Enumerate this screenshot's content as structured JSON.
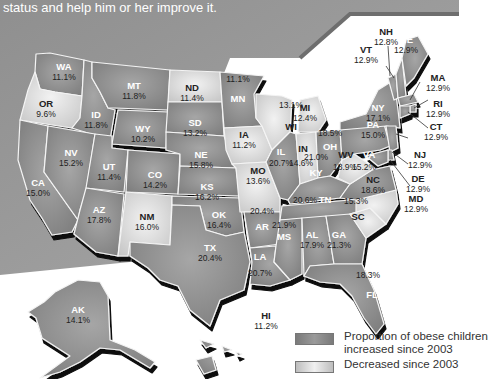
{
  "caption": {
    "line1": "status and help him or her improve it."
  },
  "legend": {
    "increased_label_1": "Proportion of obese children",
    "increased_label_2": "increased since 2003",
    "decreased_label": "Decreased since 2003",
    "increased_color": "#8a8a8a",
    "decreased_color": "#d8d8d8"
  },
  "states": [
    {
      "abbr": "WA",
      "value": "11.1%",
      "trend": "increased"
    },
    {
      "abbr": "OR",
      "value": "9.6%",
      "trend": "decreased"
    },
    {
      "abbr": "CA",
      "value": "15.0%",
      "trend": "increased"
    },
    {
      "abbr": "ID",
      "value": "11.8%",
      "trend": "increased"
    },
    {
      "abbr": "NV",
      "value": "15.2%",
      "trend": "increased"
    },
    {
      "abbr": "MT",
      "value": "11.8%",
      "trend": "increased"
    },
    {
      "abbr": "WY",
      "value": "10.2%",
      "trend": "increased"
    },
    {
      "abbr": "UT",
      "value": "11.4%",
      "trend": "increased"
    },
    {
      "abbr": "AZ",
      "value": "17.8%",
      "trend": "increased"
    },
    {
      "abbr": "CO",
      "value": "14.2%",
      "trend": "increased"
    },
    {
      "abbr": "NM",
      "value": "16.0%",
      "trend": "decreased"
    },
    {
      "abbr": "ND",
      "value": "11.4%",
      "trend": "decreased"
    },
    {
      "abbr": "SD",
      "value": "13.2%",
      "trend": "increased"
    },
    {
      "abbr": "NE",
      "value": "15.8%",
      "trend": "increased"
    },
    {
      "abbr": "KS",
      "value": "16.2%",
      "trend": "increased"
    },
    {
      "abbr": "OK",
      "value": "16.4%",
      "trend": "increased"
    },
    {
      "abbr": "TX",
      "value": "20.4%",
      "trend": "increased"
    },
    {
      "abbr": "MN",
      "value": "11.1%",
      "trend": "increased"
    },
    {
      "abbr": "IA",
      "value": "11.2%",
      "trend": "decreased"
    },
    {
      "abbr": "MO",
      "value": "13.6%",
      "trend": "decreased"
    },
    {
      "abbr": "AR",
      "value": "20.4%",
      "trend": "increased"
    },
    {
      "abbr": "LA",
      "value": "20.7%",
      "trend": "increased"
    },
    {
      "abbr": "WI",
      "value": "13.1%",
      "trend": "decreased"
    },
    {
      "abbr": "IL",
      "value": "20.7%",
      "trend": "increased"
    },
    {
      "abbr": "MI",
      "value": "12.4%",
      "trend": "decreased"
    },
    {
      "abbr": "IN",
      "value": "14.6%",
      "trend": "decreased"
    },
    {
      "abbr": "OH",
      "value": "18.5%",
      "trend": "increased"
    },
    {
      "abbr": "KY",
      "value": "21.0%",
      "trend": "increased"
    },
    {
      "abbr": "TN",
      "value": "20.6%",
      "trend": "increased"
    },
    {
      "abbr": "MS",
      "value": "21.9%",
      "trend": "increased"
    },
    {
      "abbr": "AL",
      "value": "17.9%",
      "trend": "increased"
    },
    {
      "abbr": "GA",
      "value": "21.3%",
      "trend": "increased"
    },
    {
      "abbr": "FL",
      "value": "18.3%",
      "trend": "increased"
    },
    {
      "abbr": "SC",
      "value": "15.3%",
      "trend": "decreased"
    },
    {
      "abbr": "NC",
      "value": "18.6%",
      "trend": "decreased"
    },
    {
      "abbr": "VA",
      "value": "15.2%",
      "trend": "increased"
    },
    {
      "abbr": "WV",
      "value": "18.9%",
      "trend": "decreased"
    },
    {
      "abbr": "PA",
      "value": "15.0%",
      "trend": "increased"
    },
    {
      "abbr": "NY",
      "value": "17.1%",
      "trend": "increased"
    },
    {
      "abbr": "VT",
      "value": "12.9%",
      "trend": "increased"
    },
    {
      "abbr": "NH",
      "value": "12.8%",
      "trend": "increased"
    },
    {
      "abbr": "ME",
      "value": "12.9%",
      "trend": "increased"
    },
    {
      "abbr": "MA",
      "value": "12.9%",
      "trend": "increased"
    },
    {
      "abbr": "RI",
      "value": "12.9%",
      "trend": "increased"
    },
    {
      "abbr": "CT",
      "value": "12.9%",
      "trend": "increased"
    },
    {
      "abbr": "NJ",
      "value": "12.9%",
      "trend": "increased"
    },
    {
      "abbr": "DE",
      "value": "12.9%",
      "trend": "increased"
    },
    {
      "abbr": "MD",
      "value": "12.9%",
      "trend": "increased"
    },
    {
      "abbr": "AK",
      "value": "14.1%",
      "trend": "increased"
    },
    {
      "abbr": "HI",
      "value": "11.2%",
      "trend": "increased"
    }
  ]
}
